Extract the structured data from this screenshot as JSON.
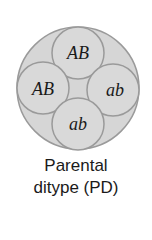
{
  "figure": {
    "spores": [
      {
        "label": "AB",
        "position": "top"
      },
      {
        "label": "AB",
        "position": "left"
      },
      {
        "label": "ab",
        "position": "right"
      },
      {
        "label": "ab",
        "position": "bottom"
      }
    ],
    "caption_line1": "Parental",
    "caption_line2": "ditype (PD)",
    "colors": {
      "ascus_fill": "#d6d6d6",
      "spore_fill": "#d9d9d9",
      "stroke": "#9a9a9a",
      "text": "#1a1a1a"
    }
  }
}
